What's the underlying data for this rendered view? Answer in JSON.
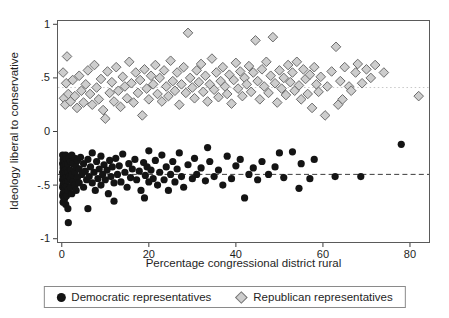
{
  "chart_data": {
    "type": "scatter",
    "title": "",
    "xlabel": "Percentage congressional district rural",
    "ylabel": "Ideology liberal to conservative",
    "xlim": [
      -1.1,
      84.6
    ],
    "ylim": [
      -1.04,
      1.04
    ],
    "grid": false,
    "legend_position": "bottom-center-boxed",
    "x_ticks": [
      {
        "v": 0,
        "label": "0"
      },
      {
        "v": 20,
        "label": "20"
      },
      {
        "v": 40,
        "label": "40"
      },
      {
        "v": 60,
        "label": "60"
      },
      {
        "v": 80,
        "label": "80"
      }
    ],
    "y_ticks": [
      {
        "v": 1,
        "label": "1"
      },
      {
        "v": 0.5,
        "label": ".5"
      },
      {
        "v": 0,
        "label": "0"
      },
      {
        "v": -0.5,
        "label": "-.5"
      },
      {
        "v": -1,
        "label": "-1"
      }
    ],
    "layout": {
      "left": 57,
      "top": 20,
      "width": 373,
      "height": 223,
      "xmin": -1.1,
      "xmax": 84.6,
      "ymin": -1.04,
      "ymax": 1.04
    },
    "frame_color": "#5a5a5a",
    "ref_lines": [
      {
        "y": 0.41,
        "style": "dotted",
        "color": "#c8c8c8",
        "name": "republican-mean-line"
      },
      {
        "y": -0.4,
        "style": "dashed",
        "color": "#3c3c3c",
        "name": "democratic-mean-line"
      }
    ],
    "series": [
      {
        "name": "Democratic representatives",
        "marker": "circle",
        "fill": "#141414",
        "points": [
          [
            0.2,
            -0.22
          ],
          [
            0.2,
            -0.3
          ],
          [
            0.2,
            -0.38
          ],
          [
            0.2,
            -0.45
          ],
          [
            0.2,
            -0.52
          ],
          [
            0.2,
            -0.6
          ],
          [
            0.3,
            -0.26
          ],
          [
            0.3,
            -0.34
          ],
          [
            0.3,
            -0.42
          ],
          [
            0.3,
            -0.5
          ],
          [
            0.3,
            -0.58
          ],
          [
            0.3,
            -0.66
          ],
          [
            0.5,
            -0.24
          ],
          [
            0.5,
            -0.32
          ],
          [
            0.5,
            -0.4
          ],
          [
            0.5,
            -0.48
          ],
          [
            0.5,
            -0.56
          ],
          [
            0.5,
            -0.64
          ],
          [
            0.7,
            -0.28
          ],
          [
            0.7,
            -0.36
          ],
          [
            0.7,
            -0.44
          ],
          [
            0.7,
            -0.52
          ],
          [
            0.7,
            -0.62
          ],
          [
            0.9,
            -0.22
          ],
          [
            0.9,
            -0.31
          ],
          [
            0.9,
            -0.39
          ],
          [
            0.9,
            -0.47
          ],
          [
            0.9,
            -0.55
          ],
          [
            0.9,
            -0.68
          ],
          [
            1.1,
            -0.26
          ],
          [
            1.1,
            -0.35
          ],
          [
            1.1,
            -0.43
          ],
          [
            1.1,
            -0.51
          ],
          [
            1.1,
            -0.6
          ],
          [
            1.4,
            -0.3
          ],
          [
            1.4,
            -0.38
          ],
          [
            1.4,
            -0.46
          ],
          [
            1.4,
            -0.55
          ],
          [
            1.4,
            -0.72
          ],
          [
            1.7,
            -0.25
          ],
          [
            1.7,
            -0.42
          ],
          [
            1.5,
            -0.85
          ],
          [
            2,
            -0.28
          ],
          [
            2,
            -0.36
          ],
          [
            2,
            -0.44
          ],
          [
            2,
            -0.52
          ],
          [
            2.3,
            -0.22
          ],
          [
            2.3,
            -0.4
          ],
          [
            2.3,
            -0.58
          ],
          [
            2.6,
            -0.3
          ],
          [
            2.6,
            -0.47
          ],
          [
            3,
            -0.25
          ],
          [
            3,
            -0.38
          ],
          [
            3,
            -0.5
          ],
          [
            3.3,
            -0.33
          ],
          [
            3.3,
            -0.55
          ],
          [
            3.6,
            -0.27
          ],
          [
            3.6,
            -0.43
          ],
          [
            4,
            -0.35
          ],
          [
            4,
            -0.48
          ],
          [
            4.3,
            -0.24
          ],
          [
            4.6,
            -0.4
          ],
          [
            5,
            -0.3
          ],
          [
            5,
            -0.52
          ],
          [
            5.4,
            -0.37
          ],
          [
            5.7,
            -0.45
          ],
          [
            6,
            -0.72
          ],
          [
            6,
            -0.26
          ],
          [
            6.3,
            -0.42
          ],
          [
            6.6,
            -0.33
          ],
          [
            7,
            -0.2
          ],
          [
            7,
            -0.48
          ],
          [
            7.4,
            -0.38
          ],
          [
            7.7,
            -0.55
          ],
          [
            8,
            -0.28
          ],
          [
            8.3,
            -0.44
          ],
          [
            8.6,
            -0.35
          ],
          [
            9,
            -0.5
          ],
          [
            9,
            -0.23
          ],
          [
            9.4,
            -0.4
          ],
          [
            9.7,
            -0.31
          ],
          [
            10,
            -0.45
          ],
          [
            10.4,
            -0.36
          ],
          [
            10.7,
            -0.58
          ],
          [
            11,
            -0.27
          ],
          [
            11.3,
            -0.42
          ],
          [
            11.6,
            -0.33
          ],
          [
            12,
            -0.48
          ],
          [
            12,
            -0.65
          ],
          [
            12.4,
            -0.25
          ],
          [
            12.8,
            -0.4
          ],
          [
            13.2,
            -0.32
          ],
          [
            13.6,
            -0.47
          ],
          [
            14,
            -0.21
          ],
          [
            14.5,
            -0.38
          ],
          [
            15,
            -0.52
          ],
          [
            15.4,
            -0.3
          ],
          [
            15.8,
            -0.43
          ],
          [
            16.2,
            -0.35
          ],
          [
            16.8,
            -0.26
          ],
          [
            17.2,
            -0.45
          ],
          [
            17.8,
            -0.37
          ],
          [
            18.2,
            -0.55
          ],
          [
            18.8,
            -0.29
          ],
          [
            19.2,
            -0.41
          ],
          [
            19.6,
            -0.33
          ],
          [
            20,
            -0.47
          ],
          [
            20,
            -0.18
          ],
          [
            19,
            -0.62
          ],
          [
            20.5,
            -0.36
          ],
          [
            21,
            -0.44
          ],
          [
            21.5,
            -0.27
          ],
          [
            22,
            -0.5
          ],
          [
            22.5,
            -0.38
          ],
          [
            23,
            -0.22
          ],
          [
            23.5,
            -0.45
          ],
          [
            24,
            -0.33
          ],
          [
            24.5,
            -0.55
          ],
          [
            25,
            -0.4
          ],
          [
            25.5,
            -0.28
          ],
          [
            26,
            -0.47
          ],
          [
            26.5,
            -0.35
          ],
          [
            27,
            -0.2
          ],
          [
            27.5,
            -0.42
          ],
          [
            28,
            -0.52
          ],
          [
            29,
            -0.31
          ],
          [
            30,
            -0.44
          ],
          [
            30.5,
            -0.25
          ],
          [
            31,
            -0.4
          ],
          [
            32,
            -0.34
          ],
          [
            33,
            -0.46
          ],
          [
            33.5,
            -0.15
          ],
          [
            34,
            -0.28
          ],
          [
            35,
            -0.42
          ],
          [
            36,
            -0.36
          ],
          [
            37,
            -0.5
          ],
          [
            38,
            -0.23
          ],
          [
            39,
            -0.44
          ],
          [
            40,
            -0.32
          ],
          [
            41,
            -0.26
          ],
          [
            42,
            -0.62
          ],
          [
            43,
            -0.4
          ],
          [
            44,
            -0.34
          ],
          [
            45,
            -0.45
          ],
          [
            46,
            -0.28
          ],
          [
            47.5,
            -0.4
          ],
          [
            49,
            -0.33
          ],
          [
            50,
            -0.2
          ],
          [
            51,
            -0.43
          ],
          [
            53,
            -0.19
          ],
          [
            54.5,
            -0.53
          ],
          [
            55,
            -0.3
          ],
          [
            57,
            -0.44
          ],
          [
            58,
            -0.26
          ],
          [
            62.8,
            -0.42
          ],
          [
            68.7,
            -0.42
          ],
          [
            78,
            -0.12
          ]
        ]
      },
      {
        "name": "Republican representatives",
        "marker": "diamond",
        "fill": "#cdcdcd",
        "stroke": "#6b6b6b",
        "points": [
          [
            0.3,
            0.55
          ],
          [
            0.5,
            0.31
          ],
          [
            0.8,
            0.25
          ],
          [
            1,
            0.45
          ],
          [
            1.2,
            0.7
          ],
          [
            1.5,
            0.35
          ],
          [
            2,
            0.28
          ],
          [
            2.5,
            0.48
          ],
          [
            3,
            0.33
          ],
          [
            3.5,
            0.22
          ],
          [
            4,
            0.52
          ],
          [
            4.5,
            0.38
          ],
          [
            5,
            0.27
          ],
          [
            5.5,
            0.44
          ],
          [
            6,
            0.57
          ],
          [
            6.5,
            0.35
          ],
          [
            7,
            0.25
          ],
          [
            7.5,
            0.62
          ],
          [
            8,
            0.41
          ],
          [
            8.5,
            0.3
          ],
          [
            9,
            0.49
          ],
          [
            9.5,
            0.2
          ],
          [
            10,
            0.12
          ],
          [
            10.5,
            0.56
          ],
          [
            11,
            0.36
          ],
          [
            11.5,
            0.46
          ],
          [
            12,
            0.28
          ],
          [
            12.5,
            0.6
          ],
          [
            13,
            0.38
          ],
          [
            13.5,
            0.23
          ],
          [
            14,
            0.51
          ],
          [
            14.5,
            0.42
          ],
          [
            15,
            0.31
          ],
          [
            15.5,
            0.65
          ],
          [
            16,
            0.45
          ],
          [
            16.5,
            0.27
          ],
          [
            17,
            0.55
          ],
          [
            17.5,
            0.36
          ],
          [
            18,
            0.48
          ],
          [
            18.5,
            0.15
          ],
          [
            19,
            0.58
          ],
          [
            19.5,
            0.4
          ],
          [
            20,
            0.3
          ],
          [
            20.5,
            0.52
          ],
          [
            21,
            0.44
          ],
          [
            21.5,
            0.62
          ],
          [
            22,
            0.35
          ],
          [
            22.5,
            0.5
          ],
          [
            23,
            0.28
          ],
          [
            23.5,
            0.57
          ],
          [
            24,
            0.42
          ],
          [
            24.5,
            0.33
          ],
          [
            25,
            0.66
          ],
          [
            25.5,
            0.47
          ],
          [
            26,
            0.38
          ],
          [
            26.5,
            0.55
          ],
          [
            27,
            0.25
          ],
          [
            27.5,
            0.44
          ],
          [
            28,
            0.6
          ],
          [
            28.5,
            0.36
          ],
          [
            29,
            0.92
          ],
          [
            29.5,
            0.5
          ],
          [
            30,
            0.41
          ],
          [
            30.5,
            0.31
          ],
          [
            31,
            0.57
          ],
          [
            31.5,
            0.46
          ],
          [
            32,
            0.63
          ],
          [
            32.5,
            0.37
          ],
          [
            33,
            0.52
          ],
          [
            33.5,
            0.28
          ],
          [
            34,
            0.44
          ],
          [
            34.5,
            0.68
          ],
          [
            35,
            0.39
          ],
          [
            35.5,
            0.55
          ],
          [
            36,
            0.32
          ],
          [
            36.5,
            0.47
          ],
          [
            37,
            0.6
          ],
          [
            37.5,
            0.42
          ],
          [
            38,
            0.35
          ],
          [
            38.5,
            0.53
          ],
          [
            39,
            0.26
          ],
          [
            39.5,
            0.48
          ],
          [
            40,
            0.64
          ],
          [
            40.5,
            0.4
          ],
          [
            41,
            0.56
          ],
          [
            41.5,
            0.33
          ],
          [
            42,
            0.5
          ],
          [
            42.5,
            0.44
          ],
          [
            43,
            0.61
          ],
          [
            43.5,
            0.37
          ],
          [
            44,
            0.55
          ],
          [
            44.5,
            0.85
          ],
          [
            45,
            0.47
          ],
          [
            45.5,
            0.3
          ],
          [
            46,
            0.58
          ],
          [
            46.5,
            0.42
          ],
          [
            47,
            0.65
          ],
          [
            47.5,
            0.36
          ],
          [
            48,
            0.52
          ],
          [
            48.5,
            0.88
          ],
          [
            49,
            0.45
          ],
          [
            49.5,
            0.27
          ],
          [
            50,
            0.57
          ],
          [
            50.5,
            0.4
          ],
          [
            51,
            0.5
          ],
          [
            51.5,
            0.34
          ],
          [
            52,
            0.62
          ],
          [
            52.5,
            0.46
          ],
          [
            53,
            0.55
          ],
          [
            53.5,
            0.38
          ],
          [
            54,
            0.65
          ],
          [
            54.5,
            0.43
          ],
          [
            55,
            0.3
          ],
          [
            55.5,
            0.58
          ],
          [
            56,
            0.49
          ],
          [
            56.5,
            0.35
          ],
          [
            57,
            0.53
          ],
          [
            57.5,
            0.22
          ],
          [
            58,
            0.6
          ],
          [
            58.5,
            0.44
          ],
          [
            59,
            0.37
          ],
          [
            59.5,
            0.51
          ],
          [
            60.5,
            0.15
          ],
          [
            61,
            0.42
          ],
          [
            62,
            0.56
          ],
          [
            63,
            0.79
          ],
          [
            63.5,
            0.25
          ],
          [
            64,
            0.47
          ],
          [
            64.5,
            0.3
          ],
          [
            65,
            0.6
          ],
          [
            66,
            0.42
          ],
          [
            66.5,
            0.38
          ],
          [
            67.5,
            0.55
          ],
          [
            68,
            0.63
          ],
          [
            69,
            0.45
          ],
          [
            70,
            0.58
          ],
          [
            71,
            0.5
          ],
          [
            72,
            0.62
          ],
          [
            74,
            0.55
          ],
          [
            82,
            0.33
          ]
        ]
      }
    ]
  }
}
